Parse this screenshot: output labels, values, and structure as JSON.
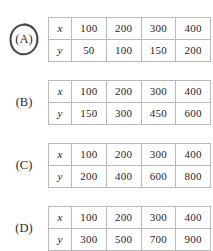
{
  "question": {
    "type": "multiple-choice-table-options",
    "selected_choice": "A",
    "annotation": "hand-drawn-oval"
  },
  "row_headers": {
    "x": "x",
    "y": "y"
  },
  "colors": {
    "table_border": "#b9b9b9",
    "text": "#1e1e1e",
    "annotation": "#4a4a4a",
    "background": "#ffffff"
  },
  "choices": [
    {
      "id": "A",
      "label": "(A)",
      "circled": true,
      "table": {
        "rows": [
          {
            "header": "x",
            "values": [
              "100",
              "200",
              "300",
              "400"
            ]
          },
          {
            "header": "y",
            "values": [
              "50",
              "100",
              "150",
              "200"
            ]
          }
        ]
      }
    },
    {
      "id": "B",
      "label": "(B)",
      "circled": false,
      "table": {
        "rows": [
          {
            "header": "x",
            "values": [
              "100",
              "200",
              "300",
              "400"
            ]
          },
          {
            "header": "y",
            "values": [
              "150",
              "300",
              "450",
              "600"
            ]
          }
        ]
      }
    },
    {
      "id": "C",
      "label": "(C)",
      "circled": false,
      "table": {
        "rows": [
          {
            "header": "x",
            "values": [
              "100",
              "200",
              "300",
              "400"
            ]
          },
          {
            "header": "y",
            "values": [
              "200",
              "400",
              "600",
              "800"
            ]
          }
        ]
      }
    },
    {
      "id": "D",
      "label": "(D)",
      "circled": false,
      "table": {
        "rows": [
          {
            "header": "x",
            "values": [
              "100",
              "200",
              "300",
              "400"
            ]
          },
          {
            "header": "y",
            "values": [
              "300",
              "500",
              "700",
              "900"
            ]
          }
        ]
      }
    }
  ]
}
